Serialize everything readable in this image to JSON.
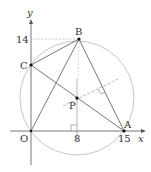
{
  "diagram": {
    "points": {
      "O": {
        "label": "O",
        "coord": [
          0,
          0
        ]
      },
      "A": {
        "label": "A",
        "coord": [
          15,
          0
        ]
      },
      "B": {
        "label": "B",
        "coord": [
          8,
          14
        ]
      },
      "C": {
        "label": "C"
      },
      "P": {
        "label": "P"
      }
    },
    "axes": {
      "x_label": "x",
      "y_label": "y"
    },
    "ticks": {
      "x": [
        "8",
        "15"
      ],
      "y": [
        "14"
      ]
    },
    "colors": {
      "line": "#555555",
      "circle": "#b0b0b0",
      "dashed": "#999999"
    }
  }
}
